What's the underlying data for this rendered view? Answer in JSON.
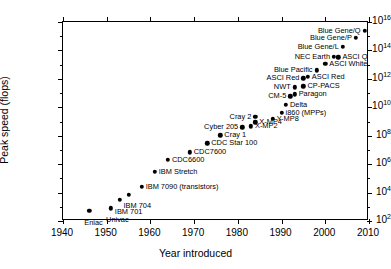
{
  "chart_data": {
    "type": "scatter",
    "title": "",
    "xlabel": "Year introduced",
    "ylabel": "Peak speed (flops)",
    "xlim": [
      1940,
      2010
    ],
    "ylim": [
      100,
      1e+16
    ],
    "yscale": "log",
    "xscale": "linear",
    "grid": false,
    "legend": "none",
    "xticks": [
      1940,
      1950,
      1960,
      1970,
      1980,
      1990,
      2000,
      2010
    ],
    "xtick_labels": [
      "1940",
      "1950",
      "1960",
      "1970",
      "1980",
      "1990",
      "2000",
      "2010"
    ],
    "yticks": [
      100,
      10000,
      1000000,
      100000000,
      10000000000,
      1000000000000,
      100000000000000,
      1e+16
    ],
    "ytick_labels": [
      "10|2",
      "10|4",
      "10|6",
      "10|8",
      "10|10",
      "10|12",
      "10|14",
      "10|16"
    ],
    "points": [
      {
        "label": "Eniac",
        "x": 1946,
        "y": 500.0,
        "side": "below"
      },
      {
        "label": "Univac",
        "x": 1951,
        "y": 800.0,
        "side": "below"
      },
      {
        "label": "IBM 701",
        "x": 1953,
        "y": 3000.0,
        "side": "below"
      },
      {
        "label": "IBM 704",
        "x": 1955,
        "y": 7000.0,
        "side": "below"
      },
      {
        "label": "IBM 7090 (transistors)",
        "x": 1958,
        "y": 26000.0,
        "side": "right"
      },
      {
        "label": "IBM Stretch",
        "x": 1961,
        "y": 300000.0,
        "side": "right"
      },
      {
        "label": "CDC6600",
        "x": 1964,
        "y": 2000000.0,
        "side": "right"
      },
      {
        "label": "CDC7600",
        "x": 1969,
        "y": 7000000.0,
        "side": "right"
      },
      {
        "label": "CDC Star 100",
        "x": 1973,
        "y": 30000000.0,
        "side": "right"
      },
      {
        "label": "Cray 1",
        "x": 1976,
        "y": 110000000.0,
        "side": "right"
      },
      {
        "label": "Cyber 205",
        "x": 1981,
        "y": 400000000.0,
        "side": "left"
      },
      {
        "label": "X-MP2",
        "x": 1983,
        "y": 450000000.0,
        "side": "right"
      },
      {
        "label": "X-MP4",
        "x": 1984,
        "y": 900000000.0,
        "side": "right"
      },
      {
        "label": "Cray 2",
        "x": 1984,
        "y": 2200000000.0,
        "side": "left"
      },
      {
        "label": "Y-MP8",
        "x": 1988,
        "y": 1600000000.0,
        "side": "right"
      },
      {
        "label": "i860 (MPPs)",
        "x": 1990,
        "y": 4000000000.0,
        "side": "right"
      },
      {
        "label": "Delta",
        "x": 1991,
        "y": 15000000000.0,
        "side": "right"
      },
      {
        "label": "CM-5",
        "x": 1992,
        "y": 60000000000.0,
        "side": "left"
      },
      {
        "label": "Paragon",
        "x": 1993,
        "y": 80000000000.0,
        "side": "right"
      },
      {
        "label": "NWT",
        "x": 1993,
        "y": 250000000000.0,
        "side": "left"
      },
      {
        "label": "CP-PACS",
        "x": 1995,
        "y": 300000000000.0,
        "side": "right"
      },
      {
        "label": "ASCI Red",
        "x": 1995,
        "y": 1100000000000.0,
        "side": "left"
      },
      {
        "label": "ASCI Red",
        "x": 1996,
        "y": 1400000000000.0,
        "side": "right"
      },
      {
        "label": "Blue Pacific",
        "x": 1998,
        "y": 4000000000000.0,
        "side": "left"
      },
      {
        "label": "ASCI White",
        "x": 2000,
        "y": 12000000000000.0,
        "side": "right"
      },
      {
        "label": "NEC Earth",
        "x": 2002,
        "y": 35000000000000.0,
        "side": "left"
      },
      {
        "label": "ASCI Q",
        "x": 2003,
        "y": 33000000000000.0,
        "side": "right"
      },
      {
        "label": "Blue Gene/L",
        "x": 2004,
        "y": 180000000000000.0,
        "side": "left"
      },
      {
        "label": "Blue Gene/P",
        "x": 2007,
        "y": 800000000000000.0,
        "side": "left"
      },
      {
        "label": "Blue Gene/Q",
        "x": 2009,
        "y": 2500000000000000.0,
        "side": "left"
      }
    ]
  }
}
